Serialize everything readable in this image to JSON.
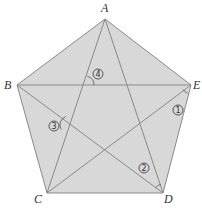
{
  "figure": {
    "type": "regular-pentagon-with-pentagram",
    "colors": {
      "background": "#ffffff",
      "fill": "#d8d8d8",
      "stroke": "#8a8a8a",
      "text": "#333333"
    },
    "vertices": [
      {
        "name": "A",
        "x": 105,
        "y": 19,
        "label_x": 101,
        "label_y": 12
      },
      {
        "name": "B",
        "x": 17,
        "y": 85,
        "label_x": 4,
        "label_y": 89
      },
      {
        "name": "C",
        "x": 47,
        "y": 193,
        "label_x": 34,
        "label_y": 203
      },
      {
        "name": "D",
        "x": 163,
        "y": 193,
        "label_x": 164,
        "label_y": 203
      },
      {
        "name": "E",
        "x": 191,
        "y": 85,
        "label_x": 193,
        "label_y": 89
      }
    ],
    "pentagon_order": [
      "A",
      "E",
      "D",
      "C",
      "B"
    ],
    "diagonals": [
      [
        "A",
        "C"
      ],
      [
        "A",
        "D"
      ],
      [
        "B",
        "E"
      ],
      [
        "B",
        "D"
      ],
      [
        "C",
        "E"
      ]
    ],
    "angles": [
      {
        "label": "1",
        "glyph": "①",
        "x": 178,
        "y": 110,
        "arc_center": [
          191,
          85
        ],
        "arc_from": 150,
        "arc_to": 112
      },
      {
        "label": "2",
        "glyph": "②",
        "x": 144,
        "y": 168,
        "arc_center": [
          163,
          193
        ],
        "arc_from": 215,
        "arc_to": 255
      },
      {
        "label": "3",
        "glyph": "③",
        "x": 54,
        "y": 126,
        "arc_center": [
          69,
          125
        ],
        "arc_from": 150,
        "arc_to": 250
      },
      {
        "label": "4",
        "glyph": "④",
        "x": 98,
        "y": 74,
        "arc_center": [
          85,
          85
        ],
        "arc_from": 285,
        "arc_to": 360
      }
    ]
  }
}
